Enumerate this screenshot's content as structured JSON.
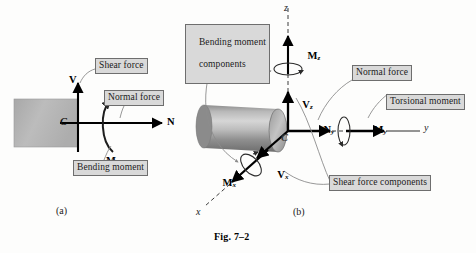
{
  "figure": {
    "caption": "Fig. 7–2",
    "panel_a_label": "(a)",
    "panel_b_label": "(b)"
  },
  "panel_a": {
    "point_label": "C",
    "vectors": [
      {
        "name": "shear-force",
        "symbol": "V",
        "subscript": ""
      },
      {
        "name": "normal-force",
        "symbol": "N",
        "subscript": ""
      },
      {
        "name": "bending-moment",
        "symbol": "M",
        "subscript": ""
      }
    ],
    "callouts": [
      {
        "name": "shear-force-callout",
        "text": "Shear force"
      },
      {
        "name": "normal-force-callout",
        "text": "Normal force"
      },
      {
        "name": "bending-moment-callout",
        "text": "Bending moment"
      }
    ]
  },
  "panel_b": {
    "point_label": "C",
    "axes": [
      {
        "name": "z-axis",
        "label": "z"
      },
      {
        "name": "y-axis",
        "label": "y"
      },
      {
        "name": "x-axis",
        "label": "x"
      }
    ],
    "vectors": [
      {
        "name": "bending-moment-z",
        "symbol": "M",
        "subscript": "z"
      },
      {
        "name": "shear-force-z",
        "symbol": "V",
        "subscript": "z"
      },
      {
        "name": "normal-force-y",
        "symbol": "N",
        "subscript": "y"
      },
      {
        "name": "torsional-moment-y",
        "symbol": "M",
        "subscript": "y"
      },
      {
        "name": "bending-moment-x",
        "symbol": "M",
        "subscript": "x"
      },
      {
        "name": "shear-force-x",
        "symbol": "V",
        "subscript": "x"
      }
    ],
    "callouts": [
      {
        "name": "bending-moment-components-callout",
        "line1": "Bending moment",
        "line2": "components"
      },
      {
        "name": "normal-force-callout",
        "text": "Normal force"
      },
      {
        "name": "torsional-moment-callout",
        "text": "Torsional moment"
      },
      {
        "name": "shear-force-components-callout",
        "text": "Shear force components"
      }
    ]
  },
  "colors": {
    "callout_fill": "#d9d9d9",
    "callout_border": "#6e6e6e",
    "block_fill": "#b3b3b3",
    "leader_line": "#8c8c8c",
    "vector_stroke": "#000000",
    "dashed_axis": "#3d3d3d"
  }
}
